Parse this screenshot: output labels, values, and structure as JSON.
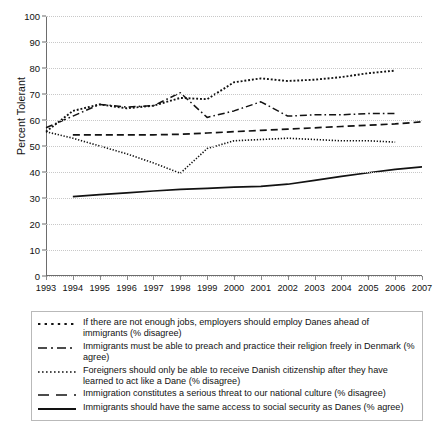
{
  "chart_data": {
    "type": "line",
    "title": "",
    "xlabel": "",
    "ylabel": "Percent Tolerant",
    "xlim": [
      1993,
      2007
    ],
    "ylim": [
      0,
      100
    ],
    "grid": true,
    "legend_position": "bottom",
    "x": [
      1993,
      1994,
      1995,
      1996,
      1997,
      1998,
      1999,
      2000,
      2001,
      2002,
      2003,
      2004,
      2005,
      2006,
      2007
    ],
    "yticks": [
      0,
      10,
      20,
      30,
      40,
      50,
      60,
      70,
      80,
      90,
      100
    ],
    "xticks": [
      "1993",
      "1994",
      "1995",
      "1996",
      "1997",
      "1998",
      "1999",
      "2000",
      "2001",
      "2002",
      "2003",
      "2004",
      "2005",
      "2006",
      "2007"
    ],
    "series": [
      {
        "name": "If there are not enough jobs, employers should employ Danes ahead of immigrants (% disagree)",
        "style": "coarse-dotted",
        "x": [
          1993,
          1994,
          1995,
          1996,
          1997,
          1998,
          1999,
          2000,
          2001,
          2002,
          2003,
          2004,
          2005,
          2006
        ],
        "values": [
          55.5,
          63.5,
          66.0,
          64.5,
          65.5,
          68.5,
          68.0,
          74.5,
          76.0,
          75.0,
          75.5,
          76.5,
          78.0,
          79.0
        ]
      },
      {
        "name": "Immigrants must be able to preach and practice their religion freely in Denmark (% agree)",
        "style": "dash-dot",
        "x": [
          1993,
          1994,
          1995,
          1996,
          1997,
          1998,
          1999,
          2000,
          2001,
          2002,
          2003,
          2004,
          2005,
          2006
        ],
        "values": [
          57.0,
          61.5,
          66.0,
          65.0,
          65.5,
          70.5,
          61.0,
          63.5,
          67.0,
          61.5,
          62.0,
          62.0,
          62.5,
          62.5
        ]
      },
      {
        "name": "Foreigners should only be able to receive Danish citizenship after they have learned to act like a Dane (% disagree)",
        "style": "fine-dotted",
        "x": [
          1993,
          1994,
          1995,
          1996,
          1997,
          1998,
          1999,
          2000,
          2001,
          2002,
          2003,
          2004,
          2005,
          2006
        ],
        "values": [
          55.5,
          53.0,
          50.0,
          47.0,
          43.5,
          39.5,
          49.0,
          52.0,
          52.5,
          53.0,
          52.5,
          52.0,
          52.0,
          51.5
        ]
      },
      {
        "name": "Immigration constitutes a serious threat to our national culture (% disagree)",
        "style": "dashed",
        "x": [
          1994,
          1995,
          1996,
          1997,
          1998,
          1999,
          2000,
          2001,
          2002,
          2003,
          2004,
          2005,
          2006,
          2007
        ],
        "values": [
          54.3,
          54.3,
          54.3,
          54.3,
          54.5,
          55.0,
          55.5,
          56.0,
          56.5,
          57.0,
          57.5,
          58.0,
          58.5,
          59.3
        ]
      },
      {
        "name": "Immigrants should have the same access to social security as Danes (% agree)",
        "style": "solid",
        "x": [
          1994,
          1995,
          1996,
          1997,
          1998,
          1999,
          2000,
          2001,
          2002,
          2003,
          2004,
          2005,
          2006,
          2007
        ],
        "values": [
          30.5,
          31.3,
          32.0,
          32.7,
          33.3,
          33.7,
          34.2,
          34.5,
          35.3,
          36.8,
          38.3,
          39.7,
          41.0,
          42.0
        ]
      }
    ]
  },
  "legend": {
    "items": [
      {
        "label": "If there are not enough jobs, employers should employ Danes ahead of immigrants (% disagree)",
        "style": "coarse-dotted"
      },
      {
        "label": "Immigrants must be able to preach and practice their religion freely in Denmark (% agree)",
        "style": "dash-dot"
      },
      {
        "label": "Foreigners should only be able to receive Danish citizenship after they have learned to act like a Dane (% disagree)",
        "style": "fine-dotted"
      },
      {
        "label": "Immigration constitutes a serious threat to our national culture (% disagree)",
        "style": "dashed"
      },
      {
        "label": "Immigrants should have the same access to social security as Danes (% agree)",
        "style": "solid"
      }
    ]
  },
  "colors": {
    "line": "#121212",
    "grid": "#c8c8c8",
    "axis": "#6d6d6d",
    "text": "#111111",
    "legend_border": "#b9b9b9"
  }
}
